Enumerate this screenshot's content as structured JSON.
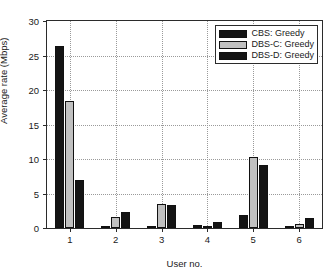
{
  "chart_data": {
    "type": "bar",
    "title": "",
    "xlabel": "User no.",
    "ylabel": "Average rate (Mbps)",
    "categories": [
      "1",
      "2",
      "3",
      "4",
      "5",
      "6"
    ],
    "ylim": [
      0,
      30
    ],
    "yticks": [
      0,
      5,
      10,
      15,
      20,
      25,
      30
    ],
    "ytick_labels": [
      "0",
      "5",
      "10",
      "15",
      "20",
      "25",
      "30"
    ],
    "grid": true,
    "legend_position": "top-right",
    "series": [
      {
        "name": "CBS: Greedy",
        "color": "#141414",
        "values": [
          26.4,
          0.2,
          0.3,
          0.5,
          1.9,
          0.1
        ]
      },
      {
        "name": "DBS-C: Greedy",
        "color": "#c0c0c0",
        "values": [
          18.4,
          1.6,
          3.5,
          0.3,
          10.3,
          0.6
        ]
      },
      {
        "name": "DBS-D: Greedy",
        "color": "#141414",
        "values": [
          7.0,
          2.3,
          3.4,
          0.9,
          9.2,
          1.4
        ]
      }
    ]
  }
}
